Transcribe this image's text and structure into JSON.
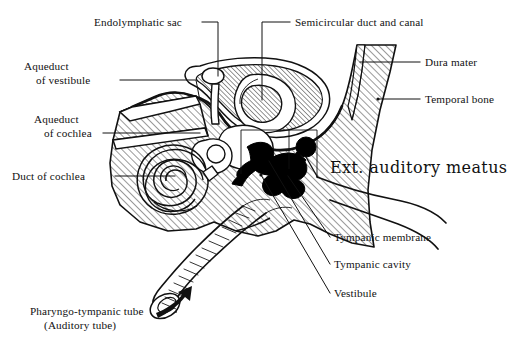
{
  "figure": {
    "background_color": "#ffffff",
    "ink_color": "#111111"
  },
  "labels": {
    "endolymphatic_sac": "Endolymphatic sac",
    "semicircular": "Semicircular duct and canal",
    "aqueduct_vestibule_line1": "Aqueduct",
    "aqueduct_vestibule_line2": "of vestibule",
    "aqueduct_cochlea_line1": "Aqueduct",
    "aqueduct_cochlea_line2": "of cochlea",
    "duct_of_cochlea": "Duct of cochlea",
    "dura_mater": "Dura mater",
    "temporal_bone": "Temporal bone",
    "ext_auditory_meatus": "Ext. auditory meatus",
    "tympanic_membrane": "Tympanic membrane",
    "tympanic_cavity": "Tympanic cavity",
    "vestibule": "Vestibule",
    "pharyngo_tympanic_line1": "Pharyngo-tympanic tube",
    "pharyngo_tympanic_line2": "(Auditory tube)"
  },
  "structures": {
    "temporal_bone": "hatched-bone-mass",
    "dura_mater": "hatched-band",
    "cochlea_spiral": "spiral-2.5-turns",
    "semicircular_canal": "loop-ring",
    "endolymphatic_sac": "small-oval",
    "vestibule": "chamber",
    "ossicles": "solid-black-bones",
    "auditory_tube": "corrugated-tube",
    "ext_auditory_meatus": "open-canal",
    "tympanic_membrane": "thin-line"
  },
  "pointer": {
    "arrow": "curved-arrow-to-tube-opening"
  }
}
